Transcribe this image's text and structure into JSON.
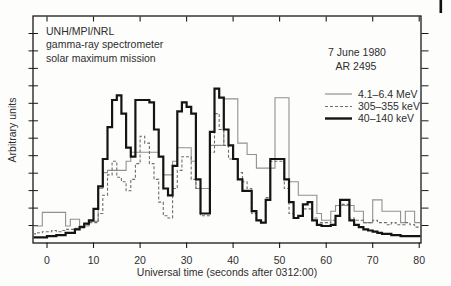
{
  "header": {
    "lines": [
      "UNH/MPI/NRL",
      "gamma-ray spectrometer",
      "solar maximum mission"
    ]
  },
  "annotation": {
    "date": "7 June 1980",
    "region": "AR 2495"
  },
  "legend": {
    "position": "upper-right",
    "entries": [
      {
        "label": "4.1–6.4 MeV",
        "style": "thin-solid",
        "color": "#919191"
      },
      {
        "label": "305–355 keV",
        "style": "dashed",
        "color": "#6e6e6e"
      },
      {
        "label": "40–140 keV",
        "style": "thick-solid",
        "color": "#141414"
      }
    ]
  },
  "chart_data": {
    "type": "line",
    "subtype": "step-histogram",
    "xlabel": "Universal time (seconds after 0312:00)",
    "ylabel": "Arbitrary units",
    "x_range": [
      -3,
      80.4
    ],
    "y_range": [
      0,
      100
    ],
    "x_major_ticks": [
      0,
      10,
      20,
      30,
      40,
      50,
      60,
      70,
      80
    ],
    "y_tick_labels_shown": false,
    "grid": false,
    "bin_start": -3,
    "bin_width_seconds": 1,
    "units_note": "y values are arbitrary units, digitized as 0-100 of plot height",
    "series": [
      {
        "name": "4.1–6.4 MeV",
        "style": "thin-solid",
        "color": "#919191",
        "values": [
          7.5,
          7.5,
          13.5,
          13.5,
          13.5,
          13.5,
          13.5,
          7.5,
          10.5,
          10.5,
          7.5,
          7.5,
          9.5,
          9.5,
          24,
          31,
          32,
          32,
          32,
          32,
          36,
          40,
          40,
          40,
          40,
          40,
          40,
          38,
          30,
          30,
          36,
          42,
          42,
          42,
          36,
          24,
          24,
          24,
          43,
          43,
          43,
          63.5,
          63.5,
          63.5,
          44,
          44,
          39,
          39,
          33,
          33,
          33,
          33,
          64,
          64,
          64,
          27,
          27,
          21,
          21,
          21,
          21,
          13,
          10,
          10,
          14,
          16.5,
          16.5,
          16.5,
          16.5,
          14,
          14,
          9,
          9,
          19,
          19,
          14,
          14,
          14,
          14,
          9,
          14,
          14,
          9
        ]
      },
      {
        "name": "305–355 keV",
        "style": "dashed",
        "color": "#6e6e6e",
        "values": [
          4,
          4.5,
          5,
          5,
          5.5,
          5,
          5.5,
          6,
          6,
          6.5,
          7,
          8,
          9,
          9,
          13,
          21,
          30,
          36,
          29,
          27,
          23,
          28,
          35,
          47,
          44,
          35,
          28,
          18,
          12,
          11,
          24,
          32,
          38,
          38,
          28,
          24,
          12,
          12,
          40,
          57,
          50,
          43,
          37,
          37,
          31,
          27,
          24,
          13,
          10,
          9,
          20,
          36,
          36,
          36,
          24,
          13,
          11,
          12,
          15,
          15,
          11,
          9,
          9,
          9,
          10,
          12,
          17,
          17,
          11,
          10,
          10,
          9,
          9,
          10,
          9,
          9,
          8,
          9,
          8,
          8,
          9,
          8,
          7
        ]
      },
      {
        "name": "40–140 keV",
        "style": "thick-solid",
        "color": "#141414",
        "values": [
          2.5,
          2.5,
          2.5,
          3,
          3,
          3.5,
          3.5,
          4.5,
          4.5,
          6,
          7,
          8.5,
          10,
          15,
          25,
          37,
          51,
          63,
          65,
          57,
          42,
          38,
          63,
          63,
          63,
          62,
          50,
          38,
          24,
          21,
          34,
          58,
          62,
          60,
          57,
          28,
          13,
          13,
          49,
          68,
          64,
          50,
          43,
          37,
          28,
          23,
          23,
          14,
          10,
          9,
          19,
          37,
          37,
          37,
          28,
          18,
          11,
          12,
          17,
          18,
          10,
          8,
          7.5,
          7.5,
          8,
          12,
          19,
          19,
          10,
          8,
          7,
          6,
          5.5,
          5,
          4.5,
          4,
          4,
          3.5,
          3.5,
          3,
          3,
          3,
          3
        ]
      }
    ],
    "ink_color": "#1a1a1a"
  }
}
